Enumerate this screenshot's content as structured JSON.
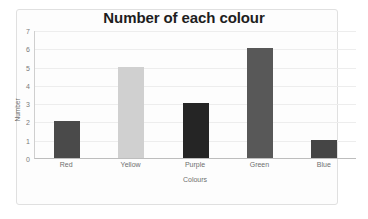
{
  "chart_data": {
    "type": "bar",
    "title": "Number of each colour",
    "xlabel": "Colours",
    "ylabel": "Number",
    "categories": [
      "Red",
      "Yellow",
      "Purple",
      "Green",
      "Blue"
    ],
    "values": [
      2,
      5,
      3,
      6,
      1
    ],
    "bar_colors": [
      "#4a4a4a",
      "#d0d0d0",
      "#252525",
      "#585858",
      "#454545"
    ],
    "ylim": [
      0,
      7
    ],
    "yticks": [
      0,
      1,
      2,
      3,
      4,
      5,
      6,
      7
    ],
    "ytick_labels": [
      "0",
      "1",
      "2",
      "3",
      "4",
      "5",
      "6",
      "7"
    ],
    "grid": true,
    "legend": false,
    "legend_position": "none",
    "plot_background": "#fdfdfd",
    "gridline_color": "#ededed",
    "axis_color": "#bdbdbd",
    "title_color": "#1e1e1e",
    "tick_label_color": "#7a7a7a"
  }
}
